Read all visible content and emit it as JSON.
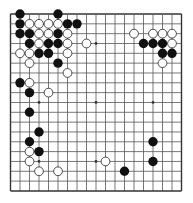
{
  "board": {
    "size": 19,
    "origin_x": 10.5,
    "origin_y": 14,
    "spacing_x": 9.5,
    "spacing_y": 9.83,
    "line_color": "#555555",
    "edge_color": "#333333",
    "background": "#ffffff",
    "star_points": [
      [
        3,
        3
      ],
      [
        9,
        3
      ],
      [
        15,
        3
      ],
      [
        3,
        9
      ],
      [
        9,
        9
      ],
      [
        15,
        9
      ],
      [
        3,
        15
      ],
      [
        9,
        15
      ],
      [
        15,
        15
      ]
    ],
    "stone_radius": 4.7
  },
  "stones": {
    "black_color": "#111111",
    "white_color": "#ffffff",
    "white_stroke": "#222222",
    "black": [
      [
        1,
        0
      ],
      [
        5,
        0
      ],
      [
        1,
        1
      ],
      [
        6,
        1
      ],
      [
        7,
        1
      ],
      [
        1,
        2
      ],
      [
        2,
        2
      ],
      [
        5,
        2
      ],
      [
        2,
        3
      ],
      [
        4,
        3
      ],
      [
        5,
        3
      ],
      [
        3,
        4
      ],
      [
        4,
        4
      ],
      [
        5,
        5
      ],
      [
        1,
        7
      ],
      [
        2,
        8
      ],
      [
        2,
        10
      ],
      [
        3,
        12
      ],
      [
        2,
        13
      ],
      [
        3,
        14
      ],
      [
        14,
        3
      ],
      [
        15,
        3
      ],
      [
        16,
        3
      ],
      [
        16,
        4
      ],
      [
        17,
        4
      ],
      [
        15,
        13
      ],
      [
        15,
        15
      ],
      [
        12,
        16
      ]
    ],
    "white": [
      [
        2,
        1
      ],
      [
        3,
        1
      ],
      [
        4,
        1
      ],
      [
        5,
        1
      ],
      [
        3,
        2
      ],
      [
        4,
        2
      ],
      [
        6,
        2
      ],
      [
        3,
        3
      ],
      [
        6,
        3
      ],
      [
        1,
        4
      ],
      [
        2,
        4
      ],
      [
        6,
        4
      ],
      [
        2,
        5
      ],
      [
        6,
        6
      ],
      [
        8,
        3
      ],
      [
        13,
        2
      ],
      [
        15,
        2
      ],
      [
        16,
        2
      ],
      [
        17,
        2
      ],
      [
        17,
        3
      ],
      [
        16,
        5
      ],
      [
        2,
        7
      ],
      [
        4,
        8
      ],
      [
        2,
        14
      ],
      [
        2,
        15
      ],
      [
        3,
        16
      ],
      [
        5,
        16
      ],
      [
        10,
        15
      ]
    ]
  }
}
